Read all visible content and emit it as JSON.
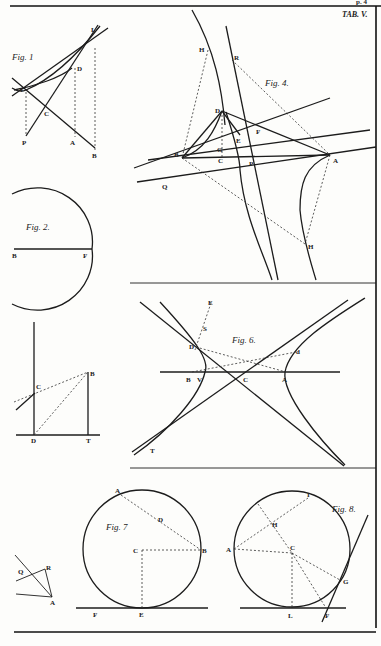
{
  "plate": {
    "title": "TAB. V.",
    "top_corner_text": "p. 4"
  },
  "figures": [
    {
      "id": "fig1",
      "caption": "Fig. 1",
      "labels": [
        "L",
        "D",
        "V",
        "C",
        "P",
        "A",
        "B"
      ]
    },
    {
      "id": "fig2",
      "caption": "Fig. 2.",
      "labels": [
        "B",
        "F"
      ]
    },
    {
      "id": "fig3",
      "caption": "",
      "labels": [
        "C",
        "B",
        "D",
        "T"
      ]
    },
    {
      "id": "fig4",
      "caption": "Fig. 4.",
      "labels": [
        "H",
        "R",
        "D",
        "E",
        "F",
        "G",
        "B",
        "C",
        "P",
        "A",
        "Q",
        "H"
      ]
    },
    {
      "id": "fig5",
      "caption": "",
      "labels": [
        "Q",
        "R",
        "A"
      ]
    },
    {
      "id": "fig6",
      "caption": "Fig. 6.",
      "labels": [
        "E",
        "S",
        "D",
        "d",
        "B",
        "V",
        "C",
        "A",
        "T"
      ]
    },
    {
      "id": "fig7",
      "caption": "Fig. 7",
      "labels": [
        "A",
        "D",
        "C",
        "B",
        "F",
        "E"
      ]
    },
    {
      "id": "fig8",
      "caption": "Fig. 8.",
      "labels": [
        "I",
        "H",
        "A",
        "C",
        "G",
        "L",
        "F"
      ]
    }
  ]
}
